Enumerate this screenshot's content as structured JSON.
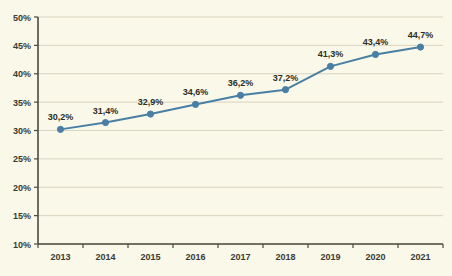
{
  "chart_data": {
    "type": "line",
    "title": "",
    "subtitle": "",
    "xlabel": "",
    "ylabel": "",
    "categories": [
      "2013",
      "2014",
      "2015",
      "2016",
      "2017",
      "2018",
      "2019",
      "2020",
      "2021"
    ],
    "values": [
      30.2,
      31.4,
      32.9,
      34.6,
      36.2,
      37.2,
      41.3,
      43.4,
      44.7
    ],
    "data_labels": [
      "30,2%",
      "31,4%",
      "32,9%",
      "34,6%",
      "36,2%",
      "37,2%",
      "41,3%",
      "43,4%",
      "44,7%"
    ],
    "ylim": [
      10,
      50
    ],
    "ytick_values": [
      10,
      15,
      20,
      25,
      30,
      35,
      40,
      45,
      50
    ],
    "ytick_labels": [
      "10%",
      "15%",
      "20%",
      "25%",
      "30%",
      "35%",
      "40%",
      "45%",
      "50%"
    ],
    "grid": true,
    "grid_axis": "y",
    "legend": "none",
    "series": [
      {
        "name": "",
        "values": [
          30.2,
          31.4,
          32.9,
          34.6,
          36.2,
          37.2,
          41.3,
          43.4,
          44.7
        ]
      }
    ],
    "colors": {
      "line": "#4a7fa5",
      "marker": "#4a7fa5",
      "background": "#faf8e8",
      "grid": "#d8d5c0",
      "axis": "#4a4a3f",
      "text": "#32322a"
    }
  }
}
